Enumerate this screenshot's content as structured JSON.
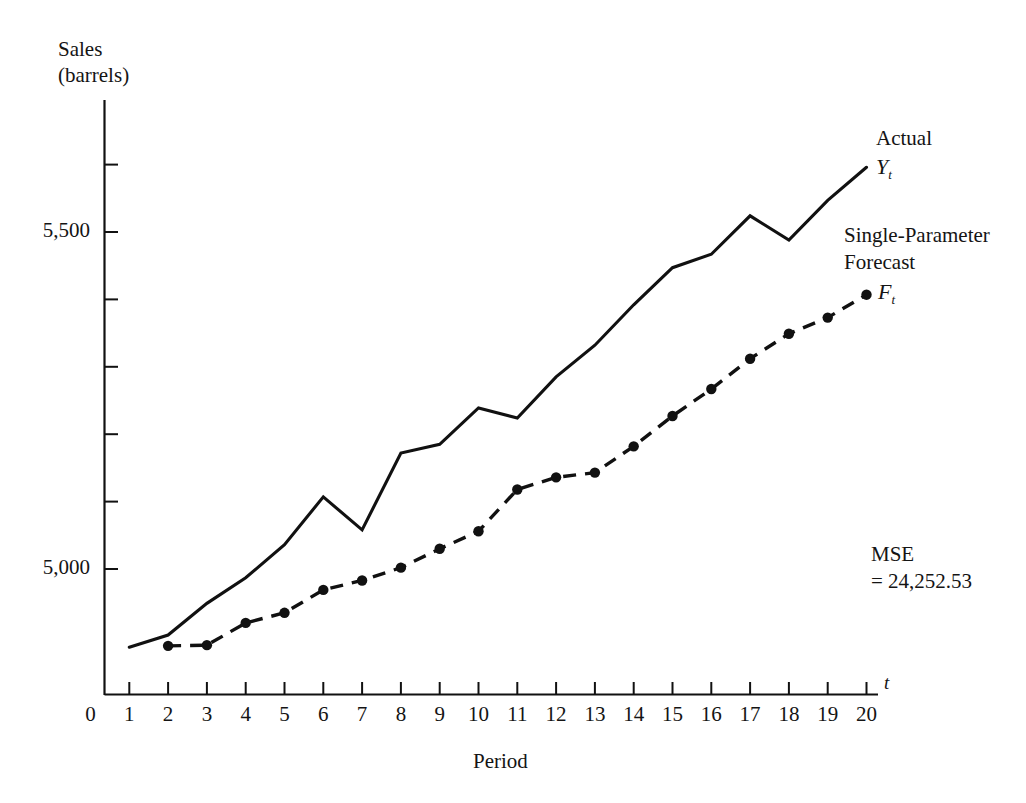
{
  "figure": {
    "y_axis_title_line1": "Sales",
    "y_axis_title_line2": "(barrels)",
    "x_axis_title": "Period",
    "x_axis_symbol": "t",
    "legend_actual": "Actual",
    "legend_actual_symbol": "Y",
    "legend_actual_subscript": "t",
    "legend_forecast_line1": "Single-Parameter",
    "legend_forecast_line2": "Forecast",
    "legend_forecast_symbol": "F",
    "legend_forecast_subscript": "t",
    "mse_label": "MSE",
    "mse_value": "= 24,252.53",
    "line_color": "#111111",
    "background": "#ffffff"
  },
  "chart_data": {
    "type": "line",
    "title": "",
    "xlabel": "Period",
    "ylabel": "Sales (barrels)",
    "xlim": [
      0,
      20
    ],
    "ylim": [
      4790,
      5680
    ],
    "grid": false,
    "legend_position": "right",
    "x": [
      1,
      2,
      3,
      4,
      5,
      6,
      7,
      8,
      9,
      10,
      11,
      12,
      13,
      14,
      15,
      16,
      17,
      18,
      19,
      20
    ],
    "xtick_labels": [
      "0",
      "1",
      "2",
      "3",
      "4",
      "5",
      "6",
      "7",
      "8",
      "9",
      "10",
      "11",
      "12",
      "13",
      "14",
      "15",
      "16",
      "17",
      "18",
      "19",
      "20"
    ],
    "ytick_labels": [
      "5,000",
      "5,500"
    ],
    "ytick_values": [
      5000,
      5500
    ],
    "yminor_ticks": [
      5100,
      5200,
      5300,
      5400,
      5600,
      5700
    ],
    "series": [
      {
        "name": "Actual",
        "symbol": "Yt",
        "style": "solid",
        "markers": false,
        "x": [
          1,
          2,
          3,
          4,
          5,
          6,
          7,
          8,
          9,
          10,
          11,
          12,
          13,
          14,
          15,
          16,
          17,
          18,
          19,
          20
        ],
        "values": [
          4884,
          4902,
          4949,
          4987,
          5036,
          5107,
          5058,
          5172,
          5185,
          5239,
          5224,
          5285,
          5332,
          5392,
          5447,
          5467,
          5524,
          5488,
          5547,
          5596
        ]
      },
      {
        "name": "Single-Parameter Forecast",
        "symbol": "Ft",
        "style": "dashed",
        "markers": true,
        "x": [
          2,
          3,
          4,
          5,
          6,
          7,
          8,
          9,
          10,
          11,
          12,
          13,
          14,
          15,
          16,
          17,
          18,
          19,
          20
        ],
        "values": [
          4886,
          4887,
          4920,
          4935,
          4969,
          4983,
          5002,
          5030,
          5056,
          5118,
          5136,
          5143,
          5182,
          5227,
          5267,
          5312,
          5349,
          5373,
          5407
        ]
      }
    ],
    "annotations": [
      {
        "text": "MSE = 24,252.53",
        "x": 20,
        "y": 5050
      }
    ]
  }
}
